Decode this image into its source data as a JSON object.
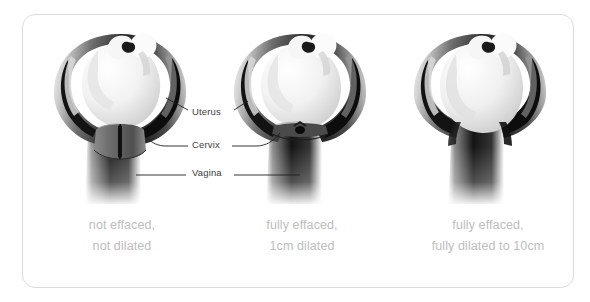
{
  "figure": {
    "card_border_color": "#dcdcdc",
    "background_color": "#ffffff"
  },
  "annotations": {
    "label_color": "#3d3d3d",
    "items": [
      {
        "id": "uterus",
        "label": "Uterus"
      },
      {
        "id": "cervix",
        "label": "Cervix"
      },
      {
        "id": "vagina",
        "label": "Vagina"
      }
    ]
  },
  "panels": [
    {
      "id": "panel-1",
      "caption_line_1": "not effaced,",
      "caption_line_2": "not dilated",
      "effacement": "not effaced",
      "dilation": "not dilated"
    },
    {
      "id": "panel-2",
      "caption_line_1": "fully effaced,",
      "caption_line_2": "1cm dilated",
      "effacement": "fully effaced",
      "dilation": "1cm dilated"
    },
    {
      "id": "panel-3",
      "caption_line_1": "fully effaced,",
      "caption_line_2": "fully dilated to 10cm",
      "effacement": "fully effaced",
      "dilation": "fully dilated to 10cm"
    }
  ],
  "caption_color": "#bdbdbd"
}
